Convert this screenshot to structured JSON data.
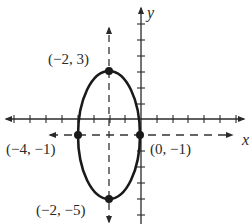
{
  "figure": {
    "type": "ellipse-graph",
    "axes": {
      "x_label": "x",
      "y_label": "y"
    },
    "ellipse": {
      "center": [
        -2,
        -1
      ],
      "horizontal_semi_axis": 2,
      "vertical_semi_axis": 4
    },
    "points": [
      {
        "label": "(−2, 3)",
        "x": -2,
        "y": 3
      },
      {
        "label": "(−4, −1)",
        "x": -4,
        "y": -1
      },
      {
        "label": "(0, −1)",
        "x": 0,
        "y": -1
      },
      {
        "label": "(−2, −5)",
        "x": -2,
        "y": -5
      }
    ],
    "colors": {
      "curve": "#1a1a1a",
      "axis": "#2a2a2a",
      "dashed": "#333333"
    }
  }
}
